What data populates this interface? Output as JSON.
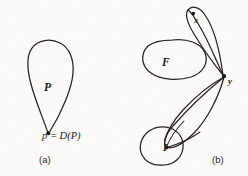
{
  "figure": {
    "background_color": "#fbfaf8",
    "ink_color": "#262321",
    "panels": [
      {
        "id": "a",
        "caption": "(a)",
        "region_label": "P",
        "point_equation": "p = D(P)",
        "description": "teardrop region P tapering to a single point p at the bottom"
      },
      {
        "id": "b",
        "caption": "(b)",
        "blob_f_label": "F",
        "blob_i_label": "I",
        "point_x_label": "x",
        "point_y_label": "y",
        "description": "blob F, elongated lens from x-blob to point y, large lens from y to blob I"
      }
    ]
  },
  "panel_a": {
    "caption": "(a)",
    "label_P": "P",
    "equation": "p = D(P)"
  },
  "panel_b": {
    "caption": "(b)",
    "label_F": "F",
    "label_I": "I",
    "label_x": "x",
    "label_y": "y"
  }
}
